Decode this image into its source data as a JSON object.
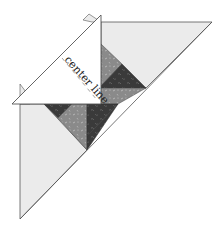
{
  "diagram": {
    "label": "center line",
    "colors": {
      "background": "#ffffff",
      "light_fabric": "#ebebeb",
      "medium_fabric": "#8a8a8a",
      "dark_fabric": "#3a3a3a",
      "template": "#ffffff",
      "outline": "#555555",
      "print_speck": "#cfcfcf"
    },
    "pieces": {
      "right_setting_triangle": "light",
      "left_setting_triangle": "light",
      "center_patchwork": [
        "dark",
        "medium",
        "dark",
        "medium",
        "dark",
        "medium"
      ],
      "overlay_template": "white triangle marked with center line"
    }
  }
}
